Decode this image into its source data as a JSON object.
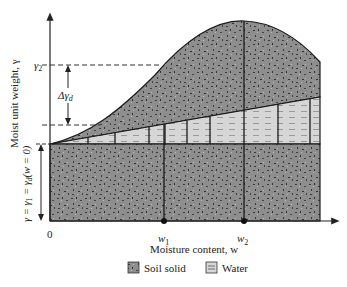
{
  "diagram": {
    "y_axis": {
      "label": "Moist unit weight, γ",
      "origin_label": "γ = γ",
      "origin_label_sub": "1",
      "origin_label_rest": " = γ",
      "origin_label_sub2": "d",
      "origin_label_tail": "(w = 0)"
    },
    "x_axis": {
      "label": "Moisture content, w",
      "zero": "0",
      "w1": "w",
      "w1_sub": "1",
      "w2": "w",
      "w2_sub": "2"
    },
    "annotations": {
      "gamma2": "γ",
      "gamma2_sub": "2",
      "delta_gamma": "Δγ",
      "delta_gamma_sub": "d"
    },
    "legend": {
      "items": [
        {
          "label": "Soil solid",
          "pattern": "speckled-gray"
        },
        {
          "label": "Water",
          "pattern": "dashed-light-gray"
        }
      ]
    },
    "colors": {
      "soil": "#8c8c8c",
      "water": "#d4d4d4",
      "line": "#1a1a1a"
    }
  }
}
